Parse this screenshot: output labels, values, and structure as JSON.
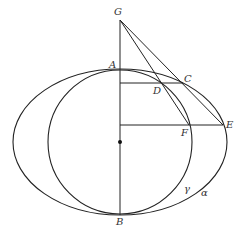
{
  "diagram": {
    "curves": {
      "alpha": {
        "label": "α",
        "cx": 120,
        "cy": 142,
        "rx": 107,
        "ry": 73
      },
      "gamma": {
        "label": "γ",
        "cx": 120,
        "cy": 142,
        "r": 72
      }
    },
    "points": {
      "G": {
        "label": "G",
        "x": 120,
        "y": 20
      },
      "A": {
        "label": "A",
        "x": 120,
        "y": 70
      },
      "B": {
        "label": "B",
        "x": 120,
        "y": 215
      },
      "C": {
        "label": "C",
        "x": 183,
        "y": 83
      },
      "D": {
        "label": "D",
        "x": 160,
        "y": 83
      },
      "E": {
        "label": "E",
        "x": 223,
        "y": 125
      },
      "F": {
        "label": "F",
        "x": 189,
        "y": 125
      },
      "O": {
        "label": "",
        "x": 120,
        "y": 142
      }
    },
    "colors": {
      "stroke": "#222222",
      "label": "#333333",
      "background": "#ffffff"
    }
  }
}
